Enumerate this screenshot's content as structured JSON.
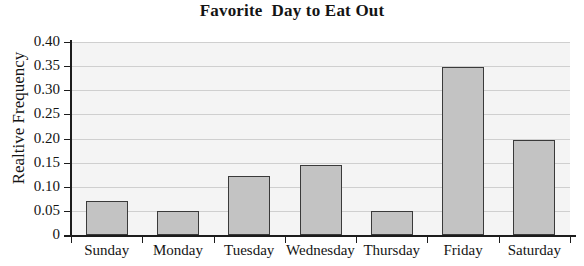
{
  "chart_data": {
    "type": "bar",
    "title": "Favorite  Day to Eat Out",
    "xlabel": "",
    "ylabel": "Realtive Frequency",
    "categories": [
      "Sunday",
      "Monday",
      "Tuesday",
      "Wednesday",
      "Thursday",
      "Friday",
      "Saturday"
    ],
    "values": [
      0.071,
      0.05,
      0.122,
      0.146,
      0.05,
      0.348,
      0.197
    ],
    "ylim": [
      0,
      0.4
    ],
    "ytick_values": [
      0,
      0.05,
      0.1,
      0.15,
      0.2,
      0.25,
      0.3,
      0.35,
      0.4
    ],
    "ytick_labels": [
      "0",
      "0.05",
      "0.10",
      "0.15",
      "0.20",
      "0.25",
      "0.30",
      "0.35",
      "0.40"
    ],
    "grid": true,
    "legend": false,
    "colors": {
      "bar_fill": "#c3c3c3",
      "bar_edge": "#3a3a3a",
      "plot_background": "#f4f4f4",
      "gridline": "#cfcfcf",
      "axis": "#1c1c1c",
      "text": "#141414"
    }
  }
}
